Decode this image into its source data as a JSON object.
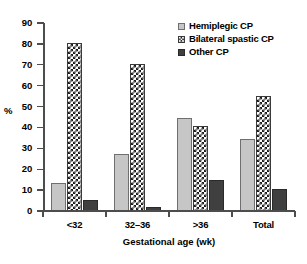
{
  "chart_data": {
    "type": "bar",
    "title": "",
    "xlabel": "Gestational age (wk)",
    "ylabel": "%",
    "categories": [
      "<32",
      "32–36",
      ">36",
      "Total"
    ],
    "series": [
      {
        "name": "Hemiplegic CP",
        "values": [
          13.5,
          27.5,
          44.5,
          34.5
        ],
        "color": "#c6c6c6",
        "pattern": "solid-light-gray"
      },
      {
        "name": "Bilateral spastic CP",
        "values": [
          80.5,
          70.3,
          40.5,
          55.3
        ],
        "color": "#1a1a1a",
        "pattern": "checkerboard"
      },
      {
        "name": "Other CP",
        "values": [
          5.5,
          2.0,
          15.0,
          10.5
        ],
        "color": "#3f3f3f",
        "pattern": "solid-dark-gray"
      }
    ],
    "ylim": [
      0,
      90
    ],
    "yticks": [
      0,
      10,
      20,
      30,
      40,
      50,
      60,
      70,
      80,
      90
    ],
    "ytick_labels": [
      "0",
      "10",
      "20",
      "30",
      "40",
      "50",
      "60",
      "70",
      "80",
      "90"
    ],
    "grid": false,
    "legend_position": "top-right"
  },
  "legend": {
    "items": [
      {
        "label": "Hemiplegic CP",
        "swatch": "light-gray-square-icon"
      },
      {
        "label": "Bilateral spastic CP",
        "swatch": "checkered-square-icon"
      },
      {
        "label": "Other CP",
        "swatch": "dark-gray-square-icon"
      }
    ]
  }
}
